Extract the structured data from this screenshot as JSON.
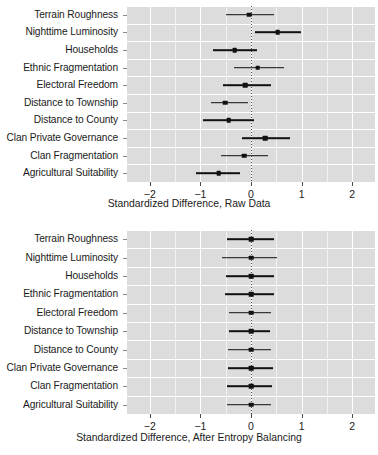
{
  "chart_data": [
    {
      "type": "scatter",
      "id": "raw-data-panel",
      "title": "",
      "xlabel": "Standardized Difference, Raw Data",
      "ylabel": "",
      "xlim": [
        -2.45,
        2.45
      ],
      "xticks": [
        -2,
        -1,
        0,
        1,
        2
      ],
      "xticklabels": [
        "−2",
        "−1",
        "0",
        "1",
        "2"
      ],
      "grid": true,
      "reference_line": 0,
      "categories": [
        "Terrain Roughness",
        "Nighttime Luminosity",
        "Households",
        "Ethnic Fragmentation",
        "Electoral Freedom",
        "Distance to Township",
        "Distance to County",
        "Clan Private Governance",
        "Clan Fragmentation",
        "Agricultural Suitability"
      ],
      "estimates": [
        -0.04,
        0.53,
        -0.32,
        0.13,
        -0.11,
        -0.51,
        -0.44,
        0.28,
        -0.13,
        -0.64
      ],
      "ci_low": [
        -0.5,
        0.07,
        -0.75,
        -0.33,
        -0.55,
        -0.8,
        -0.94,
        -0.17,
        -0.6,
        -1.08
      ],
      "ci_high": [
        0.45,
        0.98,
        0.11,
        0.65,
        0.4,
        -0.05,
        0.05,
        0.78,
        0.34,
        -0.21
      ]
    },
    {
      "type": "scatter",
      "id": "entropy-balanced-panel",
      "title": "",
      "xlabel": "Standardized Difference, After Entropy Balancing",
      "ylabel": "",
      "xlim": [
        -2.45,
        2.45
      ],
      "xticks": [
        -2,
        -1,
        0,
        1,
        2
      ],
      "xticklabels": [
        "−2",
        "−1",
        "0",
        "1",
        "2"
      ],
      "grid": true,
      "reference_line": 0,
      "categories": [
        "Terrain Roughness",
        "Nighttime Luminosity",
        "Households",
        "Ethnic Fragmentation",
        "Electoral Freedom",
        "Distance to Township",
        "Distance to County",
        "Clan Private Governance",
        "Clan Fragmentation",
        "Agricultural Suitability"
      ],
      "estimates": [
        0,
        0,
        0,
        0,
        0,
        0,
        0,
        0,
        0,
        0
      ],
      "ci_low": [
        -0.48,
        -0.57,
        -0.5,
        -0.52,
        -0.44,
        -0.43,
        -0.46,
        -0.46,
        -0.47,
        -0.47
      ],
      "ci_high": [
        0.45,
        0.52,
        0.46,
        0.45,
        0.4,
        0.37,
        0.39,
        0.44,
        0.41,
        0.4
      ]
    }
  ],
  "style": {
    "panel_background": "#dcdcdc",
    "grid_color": "#ffffff",
    "point_color": "#111111",
    "text_color": "#1b1b1b"
  }
}
